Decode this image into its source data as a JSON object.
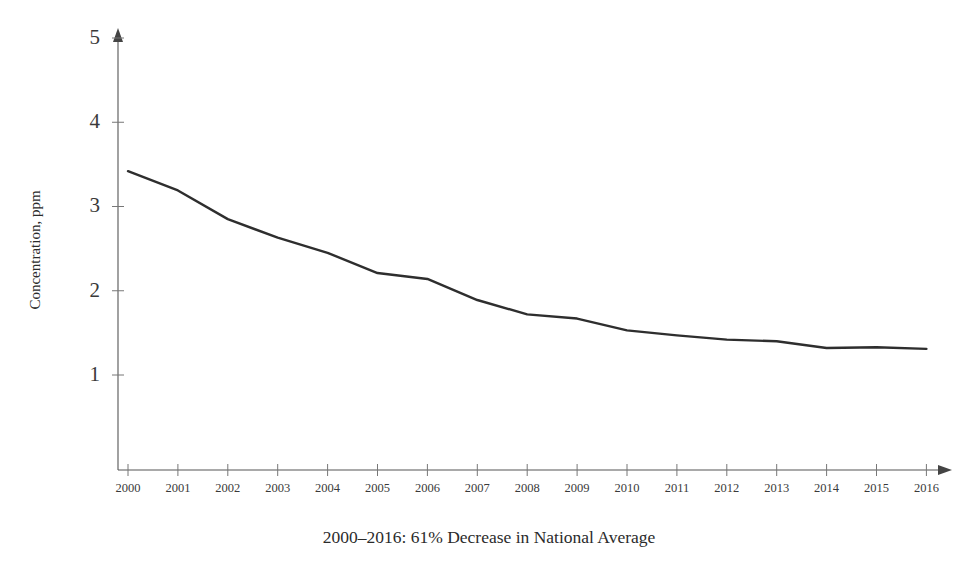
{
  "chart_data": {
    "type": "line",
    "title": "",
    "subtitle": "",
    "caption": "2000–2016:  61% Decrease in National Average",
    "xlabel": "",
    "ylabel": "Concentration, ppm",
    "x": [
      2000,
      2001,
      2002,
      2003,
      2004,
      2005,
      2006,
      2007,
      2008,
      2009,
      2010,
      2011,
      2012,
      2013,
      2014,
      2015,
      2016
    ],
    "categories": [
      "2000",
      "2001",
      "2002",
      "2003",
      "2004",
      "2005",
      "2006",
      "2007",
      "2008",
      "2009",
      "2010",
      "2011",
      "2012",
      "2013",
      "2014",
      "2015",
      "2016"
    ],
    "values": [
      3.42,
      3.19,
      2.85,
      2.63,
      2.45,
      2.21,
      2.14,
      1.89,
      1.72,
      1.67,
      1.53,
      1.47,
      1.42,
      1.4,
      1.32,
      1.33,
      1.31
    ],
    "series": [
      {
        "name": "National Average Concentration",
        "color": "#2e2e2e",
        "values": [
          3.42,
          3.19,
          2.85,
          2.63,
          2.45,
          2.21,
          2.14,
          1.89,
          1.72,
          1.67,
          1.53,
          1.47,
          1.42,
          1.4,
          1.32,
          1.33,
          1.31
        ]
      }
    ],
    "xlim": [
      2000,
      2016
    ],
    "ylim": [
      0,
      5
    ],
    "ytick_values": [
      1,
      2,
      3,
      4,
      5
    ],
    "ytick_labels": [
      "1",
      "2",
      "3",
      "4",
      "5"
    ],
    "xtick_labels": [
      "2000",
      "2001",
      "2002",
      "2003",
      "2004",
      "2005",
      "2006",
      "2007",
      "2008",
      "2009",
      "2010",
      "2011",
      "2012",
      "2013",
      "2014",
      "2015",
      "2016"
    ],
    "grid": false,
    "legend": false,
    "legend_position": "none",
    "axis_arrows": true,
    "line_color": "#2e2e2e",
    "axis_color": "#555555",
    "background_color": "#ffffff"
  }
}
